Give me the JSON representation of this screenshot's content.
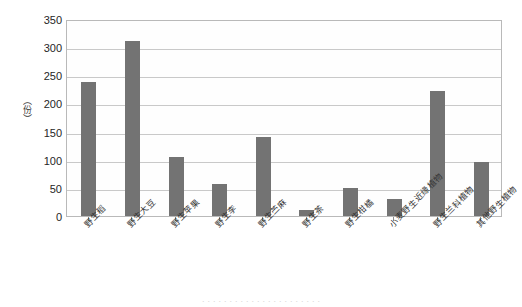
{
  "chart_data": {
    "type": "bar",
    "title": "",
    "xlabel": "",
    "ylabel": "（份）",
    "ylim": [
      0,
      350
    ],
    "ytick_step": 50,
    "yticks": [
      350,
      300,
      250,
      200,
      150,
      100,
      50,
      0
    ],
    "grid": true,
    "legend": false,
    "bar_color": "#737373",
    "categories": [
      "野生稻",
      "野生大豆",
      "野生苹果",
      "野生李",
      "野生苎麻",
      "野生茶",
      "野生柑橘",
      "小麦野生近缘植物",
      "野生兰科植物",
      "其他野生植物"
    ],
    "values": [
      238,
      311,
      104,
      56,
      141,
      11,
      50,
      31,
      222,
      96
    ]
  },
  "caption": {
    "bottom_text": "· · · · · · · · · · · · · · · · · · · · · ·"
  }
}
